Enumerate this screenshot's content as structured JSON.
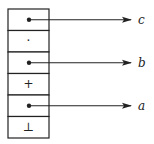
{
  "diagram": {
    "type": "stack-of-cells-with-pointers",
    "colors": {
      "stroke": "#222222",
      "background": "#ffffff"
    },
    "cells": [
      {
        "index": 0,
        "content": "pointer",
        "symbol": "",
        "target": "c"
      },
      {
        "index": 1,
        "content": "symbol",
        "symbol": "·",
        "target": null
      },
      {
        "index": 2,
        "content": "pointer",
        "symbol": "",
        "target": "b"
      },
      {
        "index": 3,
        "content": "symbol",
        "symbol": "+",
        "target": null
      },
      {
        "index": 4,
        "content": "pointer",
        "symbol": "",
        "target": "a"
      },
      {
        "index": 5,
        "content": "symbol",
        "symbol": "⊥",
        "target": null
      }
    ],
    "labels": {
      "c": "c",
      "b": "b",
      "a": "a"
    }
  }
}
